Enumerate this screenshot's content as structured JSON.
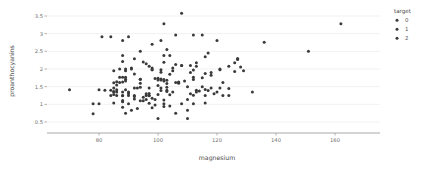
{
  "chart_data": {
    "type": "scatter",
    "title": "",
    "xlabel": "magnesium",
    "ylabel": "proanthocyanins",
    "xlim": [
      62,
      172
    ],
    "ylim": [
      0.35,
      3.72
    ],
    "xticks": [
      80,
      100,
      120,
      140,
      160
    ],
    "yticks": [
      0.5,
      1,
      1.5,
      2,
      2.5,
      3,
      3.5
    ],
    "xtick_labels": [
      "80",
      "100",
      "120",
      "140",
      "160"
    ],
    "ytick_labels": [
      "0.5",
      "1",
      "1.5",
      "2",
      "2.5",
      "3",
      "3.5"
    ],
    "grid": "horizontal",
    "legend": {
      "title": "target",
      "position": "right",
      "entries": [
        {
          "label": "0",
          "color": "#3a3a3a"
        },
        {
          "label": "1",
          "color": "#3a3a3a"
        },
        {
          "label": "2",
          "color": "#3a3a3a"
        }
      ]
    },
    "marker": {
      "shape": "circle",
      "size": 1.5,
      "color": "#3a3a3a"
    },
    "series": [
      {
        "name": "target",
        "points": [
          [
            127,
            2.29
          ],
          [
            100,
            1.28
          ],
          [
            101,
            2.81
          ],
          [
            113,
            2.18
          ],
          [
            118,
            1.82
          ],
          [
            112,
            1.97
          ],
          [
            96,
            2.15
          ],
          [
            121,
            1.98
          ],
          [
            97,
            1.25
          ],
          [
            98,
            1.98
          ],
          [
            105,
            1.95
          ],
          [
            95,
            2.2
          ],
          [
            89,
            1.95
          ],
          [
            91,
            2.0
          ],
          [
            102,
            3.28
          ],
          [
            112,
            2.96
          ],
          [
            120,
            2.81
          ],
          [
            115,
            2.96
          ],
          [
            108,
            3.58
          ],
          [
            116,
            1.87
          ],
          [
            126,
            2.18
          ],
          [
            102,
            2.19
          ],
          [
            101,
            1.91
          ],
          [
            94,
            1.71
          ],
          [
            105,
            2.03
          ],
          [
            89,
            1.66
          ],
          [
            107,
            1.63
          ],
          [
            122,
            1.62
          ],
          [
            124,
            2.08
          ],
          [
            92,
            1.25
          ],
          [
            111,
            1.9
          ],
          [
            113,
            2.08
          ],
          [
            92,
            2.29
          ],
          [
            108,
            2.1
          ],
          [
            111,
            2.1
          ],
          [
            116,
            1.04
          ],
          [
            89,
            1.41
          ],
          [
            97,
            1.24
          ],
          [
            112,
            1.77
          ],
          [
            98,
            2.03
          ],
          [
            105,
            1.35
          ],
          [
            89,
            1.77
          ],
          [
            91,
            2.03
          ],
          [
            96,
            1.14
          ],
          [
            88,
            2.38
          ],
          [
            93,
            1.46
          ],
          [
            96,
            1.25
          ],
          [
            98,
            1.98
          ],
          [
            106,
            2.96
          ],
          [
            88,
            2.21
          ],
          [
            94,
            1.6
          ],
          [
            86,
            1.25
          ],
          [
            85,
            1.46
          ],
          [
            87,
            2.0
          ],
          [
            90,
            1.25
          ],
          [
            101,
            1.98
          ],
          [
            85,
            1.95
          ],
          [
            94,
            1.71
          ],
          [
            89,
            2.0
          ],
          [
            97,
            2.08
          ],
          [
            110,
            0.83
          ],
          [
            101,
            1.46
          ],
          [
            116,
            1.25
          ],
          [
            78,
            1.02
          ],
          [
            78,
            0.73
          ],
          [
            80,
            1.41
          ],
          [
            85,
            1.28
          ],
          [
            86,
            1.41
          ],
          [
            87,
            1.62
          ],
          [
            151,
            2.5
          ],
          [
            85,
            1.35
          ],
          [
            88,
            1.77
          ],
          [
            101,
            1.39
          ],
          [
            88,
            1.35
          ],
          [
            85,
            1.36
          ],
          [
            97,
            1.31
          ],
          [
            88,
            1.25
          ],
          [
            103,
            1.48
          ],
          [
            88,
            0.92
          ],
          [
            86,
            1.35
          ],
          [
            103,
            1.36
          ],
          [
            90,
            1.02
          ],
          [
            88,
            1.11
          ],
          [
            104,
            1.27
          ],
          [
            99,
            1.14
          ],
          [
            102,
            1.12
          ],
          [
            112,
            1.02
          ],
          [
            92,
            1.46
          ],
          [
            98,
            1.17
          ],
          [
            107,
            1.6
          ],
          [
            85,
            1.04
          ],
          [
            88,
            1.24
          ],
          [
            88,
            1.07
          ],
          [
            103,
            1.4
          ],
          [
            94,
            1.1
          ],
          [
            85,
            1.61
          ],
          [
            84,
            1.4
          ],
          [
            112,
            1.26
          ],
          [
            90,
            1.31
          ],
          [
            103,
            2.55
          ],
          [
            94,
            2.5
          ],
          [
            98,
            2.7
          ],
          [
            102,
            2.38
          ],
          [
            104,
            2.38
          ],
          [
            88,
            2.81
          ],
          [
            90,
            2.91
          ],
          [
            84,
            2.91
          ],
          [
            136,
            2.76
          ],
          [
            132,
            1.35
          ],
          [
            162,
            3.28
          ],
          [
            92,
            1.86
          ],
          [
            86,
            1.64
          ],
          [
            87,
            1.77
          ],
          [
            89,
            1.71
          ],
          [
            100,
            1.69
          ],
          [
            101,
            1.69
          ],
          [
            102,
            1.66
          ],
          [
            103,
            1.68
          ],
          [
            99,
            1.73
          ],
          [
            100,
            1.74
          ],
          [
            101,
            1.72
          ],
          [
            102,
            1.7
          ],
          [
            107,
            1.62
          ],
          [
            110,
            1.5
          ],
          [
            113,
            1.4
          ],
          [
            114,
            1.38
          ],
          [
            116,
            1.42
          ],
          [
            117,
            1.39
          ],
          [
            120,
            1.35
          ],
          [
            121,
            1.46
          ],
          [
            124,
            1.25
          ],
          [
            127,
            2.29
          ],
          [
            128,
            2.06
          ],
          [
            129,
            1.95
          ],
          [
            122,
            1.25
          ],
          [
            119,
            1.3
          ],
          [
            118,
            1.46
          ],
          [
            115,
            1.5
          ],
          [
            113,
            1.35
          ],
          [
            111,
            1.3
          ],
          [
            110,
            1.14
          ],
          [
            108,
            1.02
          ],
          [
            106,
            0.75
          ],
          [
            104,
            0.95
          ],
          [
            102,
            0.94
          ],
          [
            99,
            0.98
          ],
          [
            97,
            1.03
          ],
          [
            95,
            1.1
          ],
          [
            93,
            0.88
          ],
          [
            91,
            0.83
          ],
          [
            89,
            0.75
          ],
          [
            92,
            1.15
          ],
          [
            95,
            1.2
          ],
          [
            97,
            1.46
          ],
          [
            100,
            1.53
          ],
          [
            103,
            1.59
          ],
          [
            106,
            1.62
          ],
          [
            109,
            1.66
          ],
          [
            112,
            1.7
          ],
          [
            115,
            1.75
          ],
          [
            118,
            1.9
          ],
          [
            121,
            2.0
          ],
          [
            117,
            2.45
          ],
          [
            116,
            2.35
          ],
          [
            108,
            2.1
          ],
          [
            70,
            1.41
          ],
          [
            80,
            1.02
          ],
          [
            81,
            2.91
          ],
          [
            82,
            1.4
          ],
          [
            84,
            1.25
          ],
          [
            86,
            1.55
          ],
          [
            88,
            1.63
          ],
          [
            90,
            1.35
          ],
          [
            92,
            1.22
          ],
          [
            94,
            1.48
          ],
          [
            96,
            1.3
          ],
          [
            98,
            0.9
          ],
          [
            100,
            0.6
          ],
          [
            102,
            1.02
          ],
          [
            104,
            1.85
          ],
          [
            106,
            2.13
          ],
          [
            110,
            0.6
          ],
          [
            124,
            1.45
          ],
          [
            127,
            2.27
          ],
          [
            126,
            1.93
          ]
        ]
      }
    ]
  }
}
